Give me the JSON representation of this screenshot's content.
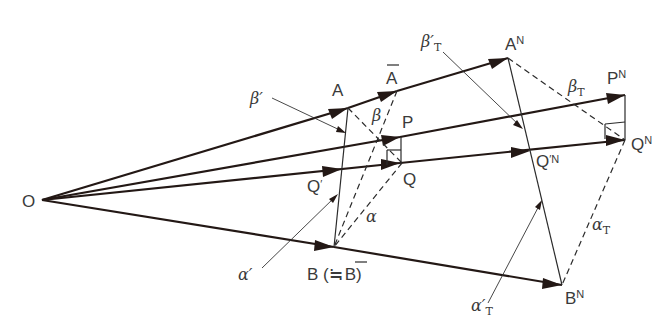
{
  "diagram": {
    "type": "vector-geometry",
    "points": {
      "O": "O",
      "A": "A",
      "A_bar": "A",
      "A_N": "A",
      "P": "P",
      "P_N": "P",
      "Q": "Q",
      "Q_prime": "Q",
      "Q_prime_N": "Q",
      "Q_N": "Q",
      "B": "B",
      "B_N": "B"
    },
    "superscripts": {
      "N": "N"
    },
    "labels": {
      "B_full_prefix": "B (",
      "approx": "≒",
      "B_bar": "B",
      "close_paren": ")",
      "prime": "′",
      "beta": "β",
      "beta_prime": "β′",
      "beta_T": "β",
      "beta_prime_T": "β′",
      "alpha": "α",
      "alpha_prime": "α′",
      "alpha_T": "α",
      "alpha_prime_T": "α′",
      "sub_T": "T"
    },
    "vectors": [
      {
        "from": "O",
        "to": "A"
      },
      {
        "from": "A",
        "to": "A_bar"
      },
      {
        "from": "A_bar",
        "to": "A_N"
      },
      {
        "from": "O",
        "to": "P"
      },
      {
        "from": "P",
        "to": "P_N"
      },
      {
        "from": "O",
        "to": "Q_prime"
      },
      {
        "from": "Q_prime",
        "to": "Q"
      },
      {
        "from": "Q",
        "to": "Q_prime_N"
      },
      {
        "from": "Q_prime_N",
        "to": "Q_N"
      },
      {
        "from": "O",
        "to": "B"
      },
      {
        "from": "B",
        "to": "B_N"
      }
    ]
  }
}
